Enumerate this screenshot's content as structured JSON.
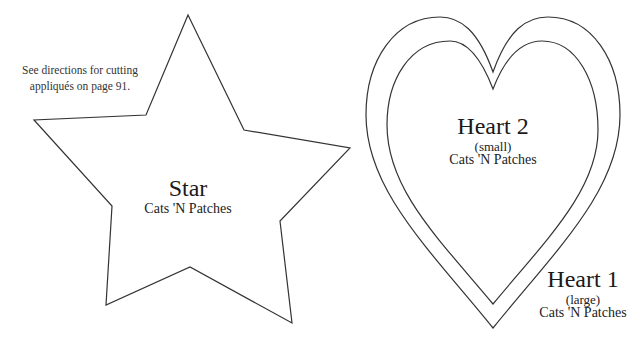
{
  "note": {
    "line1": "See directions for cutting",
    "line2": "appliqués on page 91."
  },
  "shapes": {
    "star": {
      "title": "Star",
      "subtitle": "Cats 'N Patches"
    },
    "heart2": {
      "title": "Heart 2",
      "size": "(small)",
      "subtitle": "Cats 'N Patches"
    },
    "heart1": {
      "title": "Heart 1",
      "size": "(large)",
      "subtitle": "Cats 'N Patches"
    }
  },
  "colors": {
    "outline": "#333333",
    "background": "#ffffff"
  }
}
